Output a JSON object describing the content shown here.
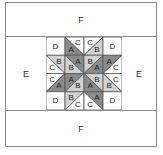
{
  "diagram": {
    "type": "quilt-block",
    "colors": {
      "A": "#8a8a8a",
      "B": "#d2d2d2",
      "C": "#ffffff",
      "D": "#ffffff",
      "line": "#555555",
      "border": "#8a8a8a"
    },
    "borders": {
      "top": "F",
      "bottom": "F",
      "left": "E",
      "right": "E"
    },
    "grid": {
      "rows": 4,
      "cols": 4,
      "cells": [
        [
          {
            "type": "plain",
            "label": "D"
          },
          {
            "type": "diag",
            "dir": "\\",
            "upper": "C",
            "lower": "A"
          },
          {
            "type": "diag",
            "dir": "/",
            "upper": "C",
            "lower": "B"
          },
          {
            "type": "plain",
            "label": "D"
          }
        ],
        [
          {
            "type": "diag",
            "dir": "\\",
            "upper": "B",
            "lower": "C"
          },
          {
            "type": "diag",
            "dir": "\\",
            "upper": "A",
            "lower": "B"
          },
          {
            "type": "diag",
            "dir": "/",
            "upper": "B",
            "lower": "A"
          },
          {
            "type": "diag",
            "dir": "/",
            "upper": "A",
            "lower": "C"
          }
        ],
        [
          {
            "type": "diag",
            "dir": "/",
            "upper": "C",
            "lower": "A"
          },
          {
            "type": "diag",
            "dir": "/",
            "upper": "A",
            "lower": "B"
          },
          {
            "type": "diag",
            "dir": "\\",
            "upper": "B",
            "lower": "A"
          },
          {
            "type": "diag",
            "dir": "\\",
            "upper": "C",
            "lower": "B"
          }
        ],
        [
          {
            "type": "plain",
            "label": "D"
          },
          {
            "type": "diag",
            "dir": "/",
            "upper": "B",
            "lower": "C"
          },
          {
            "type": "diag",
            "dir": "\\",
            "upper": "A",
            "lower": "C"
          },
          {
            "type": "plain",
            "label": "D"
          }
        ]
      ]
    }
  }
}
